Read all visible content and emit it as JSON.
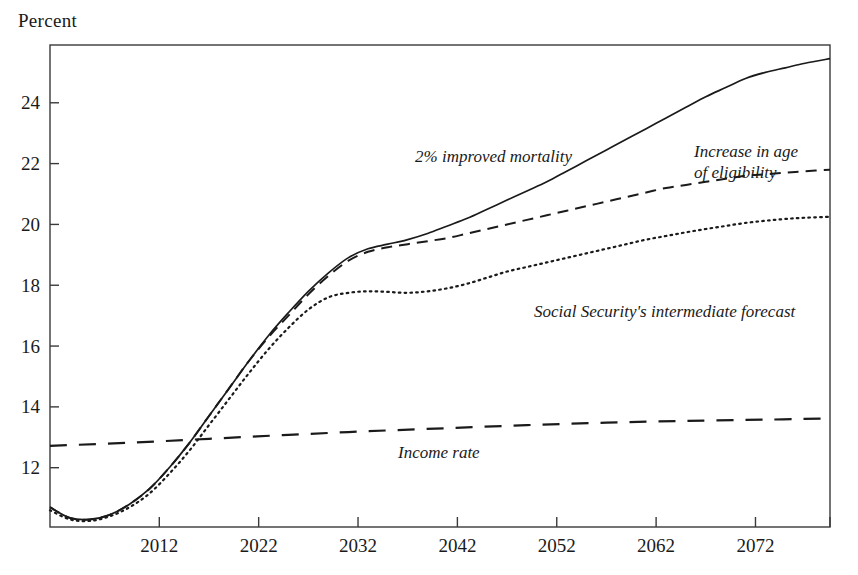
{
  "chart_data": {
    "type": "line",
    "title": "",
    "ylabel": "Percent",
    "xlabel": "",
    "xlim": [
      2001,
      2079.5
    ],
    "ylim": [
      10.05,
      25.9
    ],
    "grid": false,
    "legend_position": "inline-annotations",
    "xticks": [
      2012,
      2022,
      2032,
      2042,
      2052,
      2062,
      2072
    ],
    "xtick_labels": [
      "2012",
      "2022",
      "2032",
      "2042",
      "2052",
      "2062",
      "2072"
    ],
    "yticks": [
      12,
      14,
      16,
      18,
      20,
      22,
      24
    ],
    "ytick_labels": [
      "12",
      "14",
      "16",
      "18",
      "20",
      "22",
      "24"
    ],
    "series": [
      {
        "name": "2% improved mortality",
        "style": "solid",
        "label_text": "2% improved mortality",
        "x": [
          2001,
          2003,
          2005,
          2007,
          2009,
          2011,
          2013,
          2015,
          2017,
          2019,
          2021,
          2023,
          2025,
          2027,
          2029,
          2031,
          2033,
          2035,
          2037,
          2039,
          2041,
          2043,
          2045,
          2047,
          2049,
          2051,
          2053,
          2055,
          2057,
          2059,
          2061,
          2063,
          2065,
          2067,
          2069,
          2071,
          2073,
          2075,
          2077,
          2079.5
        ],
        "values": [
          10.7,
          10.35,
          10.3,
          10.45,
          10.8,
          11.3,
          12.0,
          12.8,
          13.7,
          14.6,
          15.5,
          16.35,
          17.1,
          17.8,
          18.4,
          18.9,
          19.2,
          19.35,
          19.5,
          19.7,
          19.95,
          20.2,
          20.5,
          20.8,
          21.1,
          21.4,
          21.75,
          22.1,
          22.45,
          22.8,
          23.15,
          23.5,
          23.85,
          24.2,
          24.5,
          24.8,
          25.0,
          25.15,
          25.3,
          25.45
        ]
      },
      {
        "name": "Increase in age of eligibility",
        "style": "dashed",
        "label_text": "Increase in age\nof eligibility",
        "x": [
          2001,
          2003,
          2005,
          2007,
          2009,
          2011,
          2013,
          2015,
          2017,
          2019,
          2021,
          2023,
          2025,
          2027,
          2029,
          2031,
          2033,
          2035,
          2037,
          2039,
          2041,
          2043,
          2045,
          2047,
          2049,
          2051,
          2053,
          2055,
          2057,
          2059,
          2061,
          2063,
          2065,
          2067,
          2069,
          2071,
          2073,
          2075,
          2077,
          2079.5
        ],
        "values": [
          10.7,
          10.35,
          10.3,
          10.45,
          10.8,
          11.3,
          12.0,
          12.8,
          13.7,
          14.6,
          15.5,
          16.3,
          17.0,
          17.7,
          18.3,
          18.8,
          19.1,
          19.25,
          19.35,
          19.45,
          19.55,
          19.7,
          19.85,
          20.0,
          20.15,
          20.3,
          20.45,
          20.6,
          20.75,
          20.9,
          21.05,
          21.2,
          21.3,
          21.4,
          21.5,
          21.6,
          21.65,
          21.7,
          21.75,
          21.8
        ]
      },
      {
        "name": "Social Security's intermediate forecast",
        "style": "dotted",
        "label_text": "Social Security's intermediate forecast",
        "x": [
          2001,
          2003,
          2005,
          2007,
          2009,
          2011,
          2013,
          2015,
          2017,
          2019,
          2021,
          2023,
          2025,
          2027,
          2029,
          2031,
          2033,
          2035,
          2037,
          2039,
          2041,
          2043,
          2045,
          2047,
          2049,
          2051,
          2053,
          2055,
          2057,
          2059,
          2061,
          2063,
          2065,
          2067,
          2069,
          2071,
          2073,
          2075,
          2077,
          2079.5
        ],
        "values": [
          10.6,
          10.3,
          10.25,
          10.4,
          10.7,
          11.15,
          11.8,
          12.55,
          13.4,
          14.25,
          15.1,
          15.9,
          16.6,
          17.2,
          17.6,
          17.75,
          17.8,
          17.78,
          17.75,
          17.8,
          17.9,
          18.05,
          18.25,
          18.45,
          18.6,
          18.75,
          18.9,
          19.05,
          19.2,
          19.35,
          19.5,
          19.62,
          19.74,
          19.85,
          19.95,
          20.05,
          20.12,
          20.18,
          20.22,
          20.25
        ]
      },
      {
        "name": "Income rate",
        "style": "long-dash",
        "label_text": "Income rate",
        "x": [
          2001,
          2009,
          2017,
          2025,
          2033,
          2041,
          2049,
          2057,
          2065,
          2073,
          2079.5
        ],
        "values": [
          12.72,
          12.82,
          12.95,
          13.08,
          13.2,
          13.3,
          13.4,
          13.48,
          13.54,
          13.58,
          13.62
        ]
      }
    ],
    "annotations": [
      {
        "text": "2% improved mortality",
        "x_px": 415,
        "y_px": 162
      },
      {
        "text": "Increase in age",
        "x_px": 694,
        "y_px": 157
      },
      {
        "text": "of eligibility",
        "x_px": 694,
        "y_px": 178
      },
      {
        "text": "Social Security's intermediate forecast",
        "x_px": 534,
        "y_px": 317
      },
      {
        "text": "Income rate",
        "x_px": 398,
        "y_px": 458
      }
    ]
  }
}
